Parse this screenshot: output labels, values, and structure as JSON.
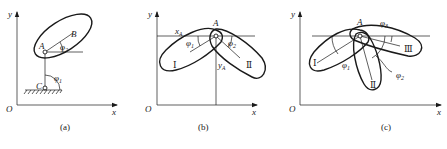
{
  "panels": [
    {
      "id": "a",
      "caption": "(a)",
      "axes": {
        "origin": "O",
        "x": "x",
        "y": "y"
      },
      "points": {
        "A": "A",
        "B": "B",
        "C": "C"
      },
      "angles": {
        "phi1": "φ",
        "phi1_sub": "1",
        "phi2": "φ",
        "phi2_sub": "2"
      }
    },
    {
      "id": "b",
      "caption": "(b)",
      "axes": {
        "origin": "O",
        "x": "x",
        "y": "y"
      },
      "points": {
        "A": "A"
      },
      "coords": {
        "xA": "x",
        "xA_sub": "A",
        "yA": "y",
        "yA_sub": "A"
      },
      "bodies": {
        "I": "Ⅰ",
        "II": "Ⅱ"
      },
      "angles": {
        "phi1": "φ",
        "phi1_sub": "1",
        "phi2": "φ",
        "phi2_sub": "2"
      }
    },
    {
      "id": "c",
      "caption": "(c)",
      "axes": {
        "origin": "O",
        "x": "x",
        "y": "y"
      },
      "points": {
        "A": "A"
      },
      "bodies": {
        "I": "Ⅰ",
        "II": "Ⅱ",
        "III": "Ⅲ"
      },
      "angles": {
        "phi1": "φ",
        "phi1_sub": "1",
        "phi2": "φ",
        "phi2_sub": "2",
        "phi3": "φ",
        "phi3_sub": "3"
      }
    }
  ]
}
